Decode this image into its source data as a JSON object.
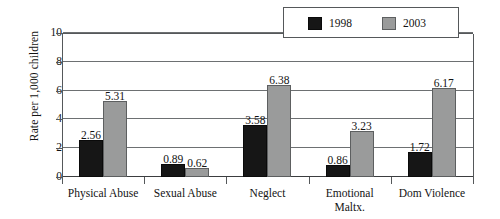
{
  "chart_data": {
    "type": "bar",
    "title": "",
    "xlabel": "",
    "ylabel": "Rate per 1,000 children",
    "ylim": [
      0,
      10
    ],
    "yticks": [
      "0",
      "2",
      "4",
      "6",
      "8",
      "10"
    ],
    "grid": true,
    "legend_position": "top-right",
    "categories": [
      "Physical Abuse",
      "Sexual Abuse",
      "Neglect",
      "Emotional Maltx.",
      "Dom Violence"
    ],
    "category_lines": [
      [
        "Physical Abuse"
      ],
      [
        "Sexual Abuse"
      ],
      [
        "Neglect"
      ],
      [
        "Emotional",
        "Maltx."
      ],
      [
        "Dom Violence"
      ]
    ],
    "series": [
      {
        "name": "1998",
        "color": "#161616",
        "values": [
          2.56,
          0.89,
          3.58,
          0.86,
          1.72
        ],
        "labels": [
          "2.56",
          "0.89",
          "3.58",
          "0.86",
          "1.72"
        ]
      },
      {
        "name": "2003",
        "color": "#9a9b9b",
        "values": [
          5.31,
          0.62,
          6.38,
          3.23,
          6.17
        ],
        "labels": [
          "5.31",
          "0.62",
          "6.38",
          "3.23",
          "6.17"
        ]
      }
    ]
  },
  "legend": {
    "items": [
      {
        "label": "1998",
        "color": "#161616"
      },
      {
        "label": "2003",
        "color": "#9a9b9b"
      }
    ]
  },
  "axes": {
    "y_title": "Rate per 1,000 children",
    "y_tick_labels": [
      "10",
      "8",
      "6",
      "4",
      "2",
      "0"
    ]
  }
}
